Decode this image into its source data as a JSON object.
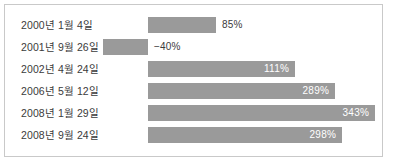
{
  "chart_data": {
    "type": "bar",
    "title": "",
    "xlabel": "",
    "ylabel": "",
    "orientation": "horizontal",
    "value_suffix": "%",
    "baseline": 0,
    "grid": false,
    "legend": null,
    "categories": [
      "2000년 1월 4일",
      "2001년 9월 26일",
      "2002년 4월 24일",
      "2006년 5월 12일",
      "2008년 1월 29일",
      "2008년 9월 24일"
    ],
    "values": [
      85,
      -40,
      111,
      289,
      343,
      298
    ],
    "value_labels": [
      "85%",
      "−40%",
      "111%",
      "289%",
      "343%",
      "298%"
    ],
    "bar_color": "#9a9a9a",
    "label_color": "#3b3b3b",
    "inbar_label_color": "#ffffff",
    "border_color": "#c9c9c9"
  },
  "rows": [
    {
      "label": "2000년 1월 4일",
      "value_label": "85%",
      "value": 85,
      "bar_left": 148,
      "bar_width": 68,
      "label_inside": false,
      "top": 14
    },
    {
      "label": "2001년 9월 26일",
      "value_label": "−40%",
      "value": -40,
      "bar_left": 103,
      "bar_width": 45,
      "label_inside": false,
      "top": 36
    },
    {
      "label": "2002년 4월 24일",
      "value_label": "111%",
      "value": 111,
      "bar_left": 148,
      "bar_width": 147,
      "label_inside": true,
      "top": 58
    },
    {
      "label": "2006년 5월 12일",
      "value_label": "289%",
      "value": 289,
      "bar_left": 148,
      "bar_width": 187,
      "label_inside": true,
      "top": 80
    },
    {
      "label": "2008년 1월 29일",
      "value_label": "343%",
      "value": 343,
      "bar_left": 148,
      "bar_width": 227,
      "label_inside": true,
      "top": 102
    },
    {
      "label": "2008년 9월 24일",
      "value_label": "298%",
      "value": 298,
      "bar_left": 148,
      "bar_width": 194,
      "label_inside": true,
      "top": 124
    }
  ]
}
